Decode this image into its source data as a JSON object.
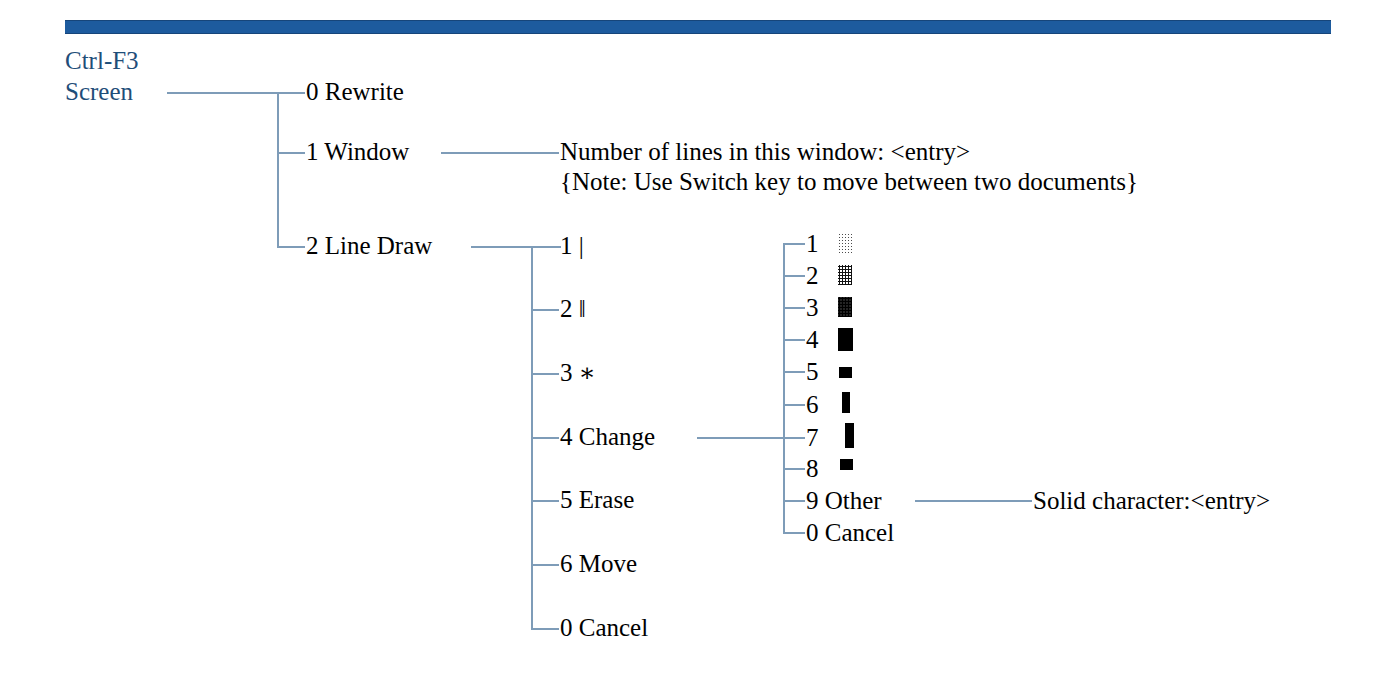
{
  "header": {
    "rule_color": "#1d5b9e",
    "accent_color": "#1f4e79",
    "line_color": "#7e9cb8"
  },
  "root": {
    "shortcut": "Ctrl-F3",
    "name": "Screen"
  },
  "level1": [
    {
      "key": "0",
      "label": "0 Rewrite"
    },
    {
      "key": "1",
      "label": "1 Window"
    },
    {
      "key": "2",
      "label": "2 Line Draw"
    }
  ],
  "window_detail": {
    "prompt": "Number of lines in this window: <entry>",
    "note": "{Note: Use Switch key to move between two documents}"
  },
  "line_draw": [
    {
      "key": "1",
      "label": "1 |"
    },
    {
      "key": "2",
      "label": "2 ‖"
    },
    {
      "key": "3",
      "label": "3 ∗"
    },
    {
      "key": "4",
      "label": "4 Change"
    },
    {
      "key": "5",
      "label": "5 Erase"
    },
    {
      "key": "6",
      "label": "6 Move"
    },
    {
      "key": "0",
      "label": "0 Cancel"
    }
  ],
  "change_menu": [
    {
      "key": "1",
      "label": "1",
      "swatch": "dots-light"
    },
    {
      "key": "2",
      "label": "2",
      "swatch": "dots-med"
    },
    {
      "key": "3",
      "label": "3",
      "swatch": "dots-dense"
    },
    {
      "key": "4",
      "label": "4",
      "swatch": "solid-tall"
    },
    {
      "key": "5",
      "label": "5",
      "swatch": "solid-small-wide"
    },
    {
      "key": "6",
      "label": "6",
      "swatch": "solid-narrow"
    },
    {
      "key": "7",
      "label": "7",
      "swatch": "solid-narrow-tall"
    },
    {
      "key": "8",
      "label": "8",
      "swatch": "solid-small-square"
    },
    {
      "key": "9",
      "label": "9 Other",
      "swatch": "none"
    },
    {
      "key": "0",
      "label": "0 Cancel",
      "swatch": "none"
    }
  ],
  "other_detail": {
    "prompt": "Solid character:<entry>"
  }
}
